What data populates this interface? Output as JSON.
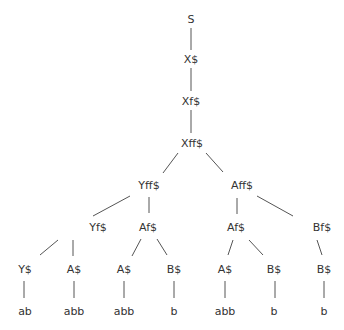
{
  "diagram": {
    "type": "parse-tree",
    "line_color": "#555555",
    "text_color": "#333333",
    "nodes": [
      {
        "id": "n0",
        "label": "S",
        "x": 191,
        "y": 19
      },
      {
        "id": "n1",
        "label": "X$",
        "x": 191,
        "y": 59
      },
      {
        "id": "n2",
        "label": "Xf$",
        "x": 191,
        "y": 101
      },
      {
        "id": "n3",
        "label": "Xff$",
        "x": 192,
        "y": 143
      },
      {
        "id": "n4",
        "label": "Yff$",
        "x": 149,
        "y": 185
      },
      {
        "id": "n5",
        "label": "Aff$",
        "x": 242,
        "y": 185
      },
      {
        "id": "n6",
        "label": "Yf$",
        "x": 98,
        "y": 227
      },
      {
        "id": "n7",
        "label": "Af$",
        "x": 148,
        "y": 227
      },
      {
        "id": "n8",
        "label": "Af$",
        "x": 236,
        "y": 227
      },
      {
        "id": "n9",
        "label": "Bf$",
        "x": 322,
        "y": 227
      },
      {
        "id": "n10",
        "label": "Y$",
        "x": 25,
        "y": 269
      },
      {
        "id": "n11",
        "label": "A$",
        "x": 74,
        "y": 269
      },
      {
        "id": "n12",
        "label": "A$",
        "x": 124,
        "y": 269
      },
      {
        "id": "n13",
        "label": "B$",
        "x": 174,
        "y": 269
      },
      {
        "id": "n14",
        "label": "A$",
        "x": 225,
        "y": 269
      },
      {
        "id": "n15",
        "label": "B$",
        "x": 274,
        "y": 269
      },
      {
        "id": "n16",
        "label": "B$",
        "x": 324,
        "y": 269
      },
      {
        "id": "n17",
        "label": "ab",
        "x": 25,
        "y": 311
      },
      {
        "id": "n18",
        "label": "abb",
        "x": 74,
        "y": 311
      },
      {
        "id": "n19",
        "label": "abb",
        "x": 124,
        "y": 311
      },
      {
        "id": "n20",
        "label": "b",
        "x": 174,
        "y": 311
      },
      {
        "id": "n21",
        "label": "abb",
        "x": 225,
        "y": 311
      },
      {
        "id": "n22",
        "label": "b",
        "x": 274,
        "y": 311
      },
      {
        "id": "n23",
        "label": "b",
        "x": 324,
        "y": 311
      }
    ],
    "edges": [
      {
        "from": "n0",
        "to": "n1",
        "x1": 191,
        "y1": 28,
        "x2": 191,
        "y2": 50
      },
      {
        "from": "n1",
        "to": "n2",
        "x1": 191,
        "y1": 68,
        "x2": 191,
        "y2": 91
      },
      {
        "from": "n2",
        "to": "n3",
        "x1": 191,
        "y1": 110,
        "x2": 191,
        "y2": 133
      },
      {
        "from": "n3",
        "to": "n4",
        "x1": 178,
        "y1": 153,
        "x2": 163,
        "y2": 173
      },
      {
        "from": "n3",
        "to": "n5",
        "x1": 206,
        "y1": 153,
        "x2": 223,
        "y2": 172
      },
      {
        "from": "n4",
        "to": "n6",
        "x1": 130,
        "y1": 196,
        "x2": 93,
        "y2": 216
      },
      {
        "from": "n4",
        "to": "n7",
        "x1": 149,
        "y1": 197,
        "x2": 149,
        "y2": 213
      },
      {
        "from": "n5",
        "to": "n8",
        "x1": 237,
        "y1": 198,
        "x2": 237,
        "y2": 214
      },
      {
        "from": "n5",
        "to": "n9",
        "x1": 257,
        "y1": 196,
        "x2": 293,
        "y2": 216
      },
      {
        "from": "n6",
        "to": "n10",
        "x1": 58,
        "y1": 240,
        "x2": 40,
        "y2": 255
      },
      {
        "from": "n6",
        "to": "n11",
        "x1": 73,
        "y1": 240,
        "x2": 73,
        "y2": 256
      },
      {
        "from": "n7",
        "to": "n12",
        "x1": 141,
        "y1": 239,
        "x2": 132,
        "y2": 256
      },
      {
        "from": "n7",
        "to": "n13",
        "x1": 157,
        "y1": 239,
        "x2": 167,
        "y2": 255
      },
      {
        "from": "n8",
        "to": "n14",
        "x1": 233,
        "y1": 240,
        "x2": 228,
        "y2": 255
      },
      {
        "from": "n8",
        "to": "n15",
        "x1": 249,
        "y1": 240,
        "x2": 263,
        "y2": 255
      },
      {
        "from": "n9",
        "to": "n16",
        "x1": 317,
        "y1": 240,
        "x2": 322,
        "y2": 255
      },
      {
        "from": "n10",
        "to": "n17",
        "x1": 24,
        "y1": 281,
        "x2": 24,
        "y2": 298
      },
      {
        "from": "n11",
        "to": "n18",
        "x1": 74,
        "y1": 281,
        "x2": 74,
        "y2": 298
      },
      {
        "from": "n12",
        "to": "n19",
        "x1": 124,
        "y1": 281,
        "x2": 124,
        "y2": 298
      },
      {
        "from": "n13",
        "to": "n20",
        "x1": 174,
        "y1": 281,
        "x2": 174,
        "y2": 298
      },
      {
        "from": "n14",
        "to": "n21",
        "x1": 225,
        "y1": 281,
        "x2": 225,
        "y2": 298
      },
      {
        "from": "n15",
        "to": "n22",
        "x1": 275,
        "y1": 281,
        "x2": 275,
        "y2": 298
      },
      {
        "from": "n16",
        "to": "n23",
        "x1": 324,
        "y1": 281,
        "x2": 324,
        "y2": 298
      }
    ]
  }
}
